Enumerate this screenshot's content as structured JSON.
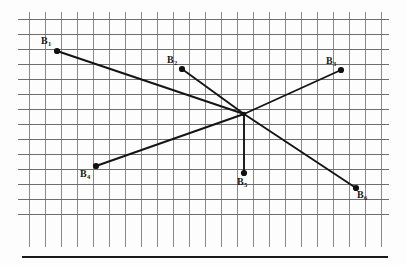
{
  "figure": {
    "background_color": "#fdfdfd",
    "grid": {
      "line_color": "#8a8a8a",
      "line_color_strong": "#6e6e6e",
      "line_width": 1,
      "cell_width": 16,
      "cell_height": 15,
      "x_start": 29,
      "x_end": 381,
      "y_start": 19,
      "y_end": 227,
      "vertical_line_top": 12,
      "vertical_line_bottom": 247,
      "horizontal_line_left": 18,
      "horizontal_line_right": 389,
      "vertical_count": 23,
      "horizontal_count": 15
    },
    "baseline_rule": {
      "color": "#1a1a1a",
      "x_start": 22,
      "x_end": 388,
      "y": 257,
      "thickness": 2.4
    },
    "center_node": {
      "label": "convergence-point",
      "x": 244,
      "y": 114
    },
    "marker": {
      "color": "#111111",
      "radius": 3.1
    },
    "line_color": "#141414",
    "line_width": 1.9,
    "points": [
      {
        "id": "B1",
        "label": "B",
        "subscript": "1",
        "x": 57,
        "y": 51,
        "label_x": 41,
        "label_y": 36,
        "connects_to_center": true
      },
      {
        "id": "B2",
        "label": "B",
        "subscript": "2",
        "x": 182,
        "y": 69,
        "label_x": 167,
        "label_y": 55,
        "connects_to_center": true
      },
      {
        "id": "B3",
        "label": "B",
        "subscript": "3",
        "x": 341,
        "y": 70,
        "label_x": 326,
        "label_y": 56,
        "connects_to_center": true
      },
      {
        "id": "B4",
        "label": "B",
        "subscript": "4",
        "x": 96,
        "y": 166,
        "label_x": 80,
        "label_y": 169,
        "connects_to_center": true
      },
      {
        "id": "B5",
        "label": "B",
        "subscript": "5",
        "x": 244,
        "y": 173,
        "label_x": 237,
        "label_y": 177,
        "connects_to_center": true
      },
      {
        "id": "B6",
        "label": "B",
        "subscript": "6",
        "x": 356,
        "y": 188,
        "label_x": 357,
        "label_y": 190,
        "connects_to_center": true
      }
    ]
  }
}
